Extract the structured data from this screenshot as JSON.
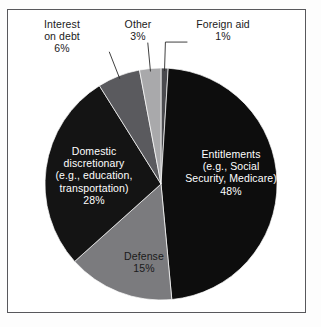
{
  "chart_data": {
    "type": "pie",
    "title": "",
    "subtitle": "",
    "xlabel": "",
    "ylabel": "",
    "grid": false,
    "legend_position": "none",
    "start_angle_deg": 0,
    "direction": "clockwise",
    "center": [
      161,
      184
    ],
    "radius": 116,
    "total_percent": 101,
    "slices": [
      {
        "name": "foreign-aid",
        "label": "Foreign aid",
        "value_label": "1%",
        "value": 1,
        "color": "#4a4a4e",
        "text_color": "#1a1a1a",
        "placement": "outside",
        "leader_line": true,
        "label_text": "Foreign aid\n1%"
      },
      {
        "name": "entitlements",
        "label": "Entitlements (e.g., Social Security, Medicare)",
        "value_label": "48%",
        "value": 48,
        "color": "#0d0d0d",
        "text_color": "#ffffff",
        "placement": "inside",
        "leader_line": false,
        "label_text": "Entitlements\n(e.g., Social\nSecurity, Medicare)\n48%"
      },
      {
        "name": "defense",
        "label": "Defense",
        "value_label": "15%",
        "value": 15,
        "color": "#7b7b7e",
        "text_color": "#1a1a1a",
        "placement": "inside",
        "leader_line": false,
        "label_text": "Defense\n15%"
      },
      {
        "name": "domestic-discretionary",
        "label": "Domestic discretionary (e.g., education, transportation)",
        "value_label": "28%",
        "value": 28,
        "color": "#141414",
        "text_color": "#ffffff",
        "placement": "inside",
        "leader_line": false,
        "label_text": "Domestic\ndiscretionary\n(e.g., education,\ntransportation)\n28%"
      },
      {
        "name": "interest-on-debt",
        "label": "Interest on debt",
        "value_label": "6%",
        "value": 6,
        "color": "#5a5a5e",
        "text_color": "#1a1a1a",
        "placement": "outside",
        "leader_line": true,
        "label_text": "Interest\non debt\n6%"
      },
      {
        "name": "other",
        "label": "Other",
        "value_label": "3%",
        "value": 3,
        "color": "#a9a9ab",
        "text_color": "#1a1a1a",
        "placement": "outside",
        "leader_line": true,
        "label_text": "Other\n3%"
      }
    ]
  },
  "frame": {
    "border_color": "#58585c",
    "background": "#ffffff"
  }
}
